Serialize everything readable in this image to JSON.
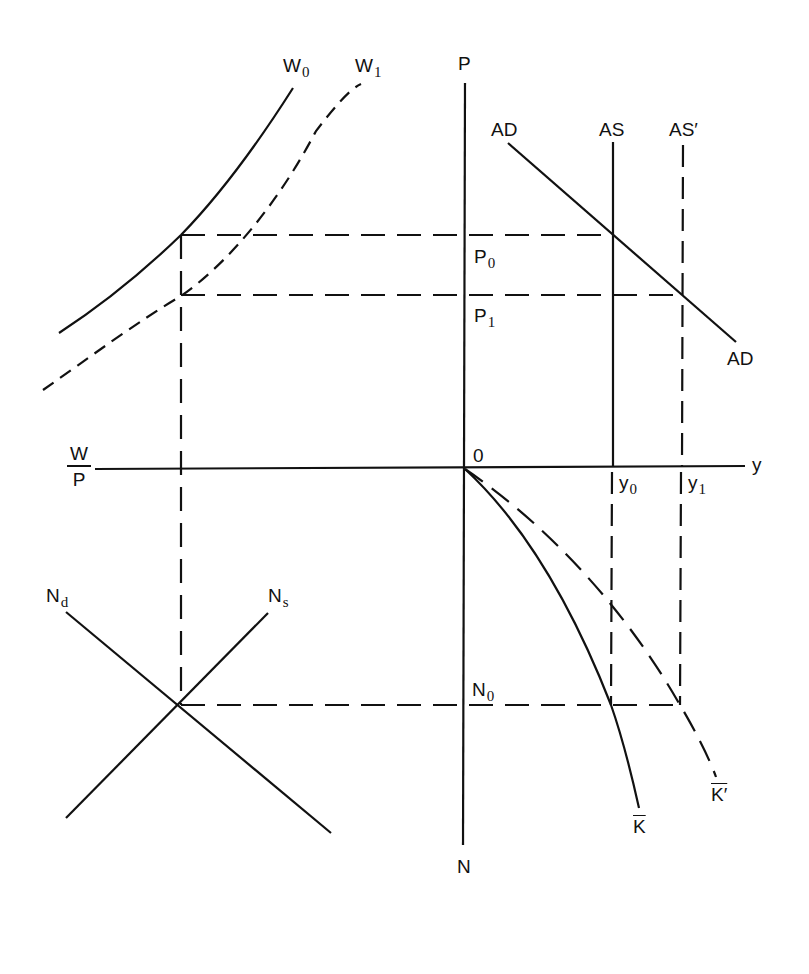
{
  "diagram": {
    "type": "four-quadrant macroeconomic diagram (labor market, production function, AD-AS)",
    "axes": {
      "price_axis": "P",
      "labor_axis": "N",
      "output_axis": "y",
      "real_wage_axis_num": "W",
      "real_wage_axis_den": "P",
      "origin": "0"
    },
    "curves": {
      "w0": {
        "name": "W",
        "sub": "0",
        "style": "solid"
      },
      "w1": {
        "name": "W",
        "sub": "1",
        "style": "dashed"
      },
      "ad_top": "AD",
      "ad_bottom": "AD",
      "as": "AS",
      "as_prime": "AS′",
      "nd": {
        "name": "N",
        "sub": "d"
      },
      "ns": {
        "name": "N",
        "sub": "s"
      },
      "k_bar": "K",
      "k_bar_prime": "K′"
    },
    "levels": {
      "p0": {
        "name": "P",
        "sub": "0"
      },
      "p1": {
        "name": "P",
        "sub": "1"
      },
      "y0": {
        "name": "y",
        "sub": "0"
      },
      "y1": {
        "name": "y",
        "sub": "1"
      },
      "n0": {
        "name": "N",
        "sub": "0"
      }
    },
    "colors": {
      "ink": "#111111",
      "background": "#ffffff"
    }
  }
}
